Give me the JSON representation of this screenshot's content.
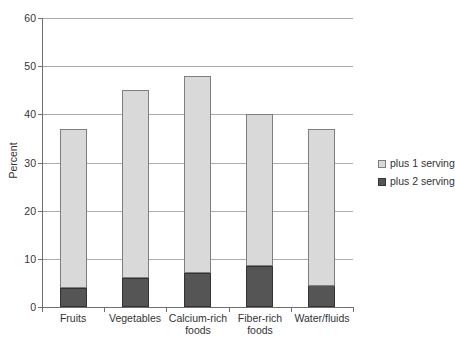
{
  "chart_data": {
    "type": "bar",
    "stacked": true,
    "title": "",
    "xlabel": "",
    "ylabel": "Percent",
    "ylim": [
      0,
      60
    ],
    "yticks": [
      0,
      10,
      20,
      30,
      40,
      50,
      60
    ],
    "grid": true,
    "legend_position": "right",
    "categories": [
      "Fruits",
      "Vegetables",
      "Calcium-rich foods",
      "Fiber-rich foods",
      "Water/fluids"
    ],
    "series": [
      {
        "name": "plus 1 serving",
        "color": "#d9d9d9",
        "border_color": "#7f7f7f",
        "values": [
          33,
          39,
          41,
          31.5,
          32.5
        ]
      },
      {
        "name": "plus 2 serving",
        "color": "#555555",
        "border_color": "#333333",
        "values": [
          4,
          6,
          7,
          8.5,
          4.5
        ]
      }
    ],
    "stack_order_bottom_to_top": [
      "plus 2 serving",
      "plus 1 serving"
    ],
    "stack_totals": [
      37,
      45,
      48,
      40,
      37
    ],
    "colors": {
      "background": "#ffffff",
      "gridline": "#ababab",
      "axis": "#6e6e6e",
      "text": "#333333"
    }
  }
}
